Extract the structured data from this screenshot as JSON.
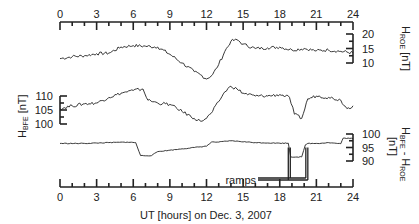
{
  "chart_data": {
    "type": "line",
    "title": "",
    "xlabel": "UT [hours] on Dec. 3, 2007",
    "x_ticks": [
      0,
      3,
      6,
      9,
      12,
      15,
      18,
      21,
      24
    ],
    "xlim": [
      0,
      24
    ],
    "grid": false,
    "annotations": [
      {
        "text": "ramps",
        "x_hours": [
          18.7,
          20.3
        ],
        "panel": "HBFE - HROE"
      }
    ],
    "panels": [
      {
        "name": "HROE",
        "ylabel": "H_ROE [nT]",
        "ylabel_main": "H",
        "ylabel_sub": "ROE",
        "ylabel_unit": "[nT]",
        "axis_side": "right",
        "y_ticks": [
          10,
          15,
          20
        ],
        "ylim": [
          10,
          20
        ],
        "x": [
          0,
          1,
          2,
          3,
          4,
          5,
          6,
          7,
          8,
          9,
          10,
          11,
          11.5,
          12,
          12.5,
          13,
          13.5,
          14,
          14.5,
          15,
          16,
          17,
          18,
          19,
          20,
          21,
          22,
          23,
          24
        ],
        "values": [
          11.5,
          12.2,
          12.5,
          13.2,
          13.4,
          15.5,
          16.0,
          15.8,
          15.5,
          13.0,
          10.0,
          7.0,
          6.0,
          4.5,
          6.0,
          9.5,
          14.0,
          17.5,
          18.0,
          16.5,
          15.0,
          15.2,
          15.5,
          14.5,
          15.0,
          14.2,
          14.5,
          14.0,
          13.5
        ]
      },
      {
        "name": "HBFE",
        "ylabel": "H_BFE [nT]",
        "ylabel_main": "H",
        "ylabel_sub": "BFE",
        "ylabel_unit": "[nT]",
        "axis_side": "left",
        "y_ticks": [
          100,
          105,
          110
        ],
        "ylim": [
          100,
          110
        ],
        "x": [
          0,
          1,
          2,
          3,
          4,
          5,
          6,
          6.8,
          7.2,
          8,
          9,
          10,
          11,
          11.5,
          12,
          12.5,
          13,
          13.5,
          14,
          14.5,
          15,
          16,
          17,
          18,
          18.8,
          19.2,
          19.8,
          20.3,
          21,
          22,
          23,
          23.5,
          24
        ],
        "values": [
          105.5,
          106.5,
          107.2,
          107.5,
          109.5,
          111.0,
          112.0,
          112.5,
          108.5,
          107.5,
          107.0,
          104.5,
          102.0,
          101.0,
          102.0,
          104.5,
          108.0,
          111.5,
          113.5,
          112.5,
          111.0,
          110.0,
          110.0,
          110.5,
          109.5,
          103.5,
          102.0,
          109.0,
          110.0,
          109.5,
          108.5,
          105.5,
          106.5
        ]
      },
      {
        "name": "HBFE - HROE",
        "ylabel": "H_BFE - H_ROE [nT]",
        "ylabel_main": "H",
        "ylabel_sub1": "BFE",
        "ylabel_sep": " - H",
        "ylabel_sub2": "ROE",
        "ylabel_unit": "[nT]",
        "axis_side": "right",
        "y_ticks": [
          90,
          95,
          100
        ],
        "ylim": [
          90,
          100
        ],
        "x": [
          0,
          2,
          4,
          5.5,
          6.2,
          6.6,
          7.5,
          8,
          9,
          10,
          11,
          12,
          12.4,
          13,
          14,
          16,
          18,
          18.7,
          18.9,
          19.8,
          20.1,
          20.3,
          21,
          22,
          23,
          23.2,
          24
        ],
        "values": [
          96.5,
          96.5,
          96.8,
          97.0,
          96.8,
          92.0,
          92.0,
          93.5,
          94.0,
          94.5,
          95.0,
          95.5,
          97.0,
          97.0,
          97.5,
          96.8,
          96.6,
          96.6,
          91.5,
          91.5,
          96.0,
          96.5,
          96.5,
          96.8,
          96.4,
          98.5,
          98.3
        ]
      }
    ]
  },
  "labels": {
    "xlabel": "UT [hours] on Dec. 3, 2007",
    "ramps": "ramps",
    "x_ticks": [
      "0",
      "3",
      "6",
      "9",
      "12",
      "15",
      "18",
      "21",
      "24"
    ],
    "hroe_ticks": [
      "20",
      "15",
      "10"
    ],
    "hbfe_ticks": [
      "110",
      "105",
      "100"
    ],
    "diff_ticks": [
      "100",
      "95",
      "90"
    ],
    "hroe_title_main": "H",
    "hroe_title_sub": "ROE",
    "hroe_title_unit": " [nT]",
    "hbfe_title_main": "H",
    "hbfe_title_sub": "BFE",
    "hbfe_title_unit": " [nT]",
    "diff_title_main": "H",
    "diff_title_sub1": "BFE",
    "diff_title_sep": " - H",
    "diff_title_sub2": "ROE",
    "diff_title_unit": "[nT]"
  }
}
